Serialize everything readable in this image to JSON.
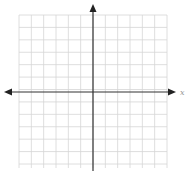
{
  "diagram": {
    "type": "coordinate-plane",
    "grid": {
      "columns": 12,
      "rows": 12,
      "left": 19,
      "top": 15,
      "right": 167,
      "bottom": 164,
      "color": "#d6d6d6"
    },
    "axes": {
      "origin_x": 93,
      "origin_y": 92,
      "color": "#333333",
      "x_axis_label": "x",
      "x_arrows": "both",
      "y_arrows": "top"
    }
  }
}
